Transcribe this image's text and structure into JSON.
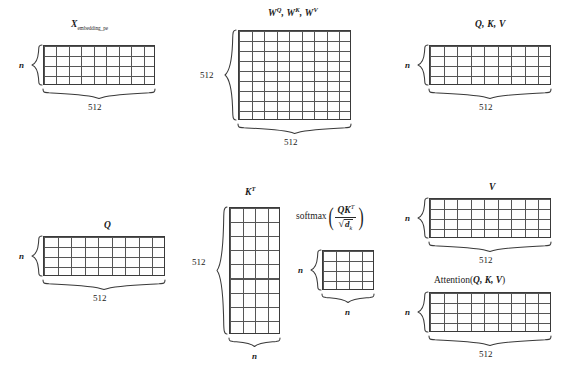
{
  "figure": {
    "type": "diagram",
    "background": "#ffffff",
    "line_color": "#555555"
  },
  "blocks": [
    {
      "id": "x-embedding-pe",
      "title": "X",
      "title_sub": "embedding_pe",
      "rows": 4,
      "cols": 9,
      "row_label": "n",
      "col_label": "512"
    },
    {
      "id": "w-qkv",
      "title": "W",
      "title_parts": [
        "W",
        "Q",
        ", ",
        "W",
        "K",
        ", ",
        "W",
        "V"
      ],
      "rows": 9,
      "cols": 9,
      "row_label": "512",
      "col_label": "512"
    },
    {
      "id": "qkv",
      "title": "Q, K, V",
      "rows": 4,
      "cols": 9,
      "row_label": "n",
      "col_label": "512"
    },
    {
      "id": "q",
      "title": "Q",
      "rows": 4,
      "cols": 9,
      "row_label": "n",
      "col_label": "512"
    },
    {
      "id": "k-transpose",
      "title": "K",
      "title_sup": "T",
      "rows": 9,
      "cols": 4,
      "row_label": "512",
      "col_label": "n"
    },
    {
      "id": "softmax-result",
      "title": "softmax(QKᵀ/√d_k)",
      "rows": 4,
      "cols": 4,
      "row_label": "n",
      "col_label": "n"
    },
    {
      "id": "v",
      "title": "V",
      "rows": 4,
      "cols": 9,
      "row_label": "n",
      "col_label": "512"
    },
    {
      "id": "attention-result",
      "title": "Attention(Q, K, V)",
      "rows": 4,
      "cols": 9,
      "row_label": "n",
      "col_label": "512"
    }
  ],
  "labels": {
    "x_title_base": "X",
    "x_title_sub": "embedding_pe",
    "w_q": "W",
    "w_q_sup": "Q",
    "w_k": "W",
    "w_k_sup": "K",
    "w_v": "W",
    "w_v_sup": "V",
    "comma": ", ",
    "qkv_title": "Q, K, V",
    "q_title": "Q",
    "k_title": "K",
    "k_sup": "T",
    "v_title": "V",
    "attention_prefix": "Attention(",
    "attention_args": "Q, K, V",
    "attention_suffix": ")",
    "softmax_word": "softmax",
    "paren_open": "(",
    "paren_close": ")",
    "numerator": "QK",
    "numerator_sup": "T",
    "radical": "√",
    "denominator": "d",
    "denominator_sub": "k",
    "dim_512": "512",
    "dim_n": "n"
  }
}
